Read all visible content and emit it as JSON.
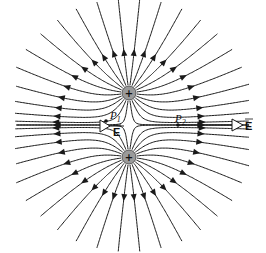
{
  "diagram": {
    "charges": [
      {
        "id": "q1",
        "sign": "+",
        "label": "+",
        "x": 129,
        "y": 93
      },
      {
        "id": "q2",
        "sign": "+",
        "label": "+",
        "x": 129,
        "y": 157
      }
    ],
    "points": [
      {
        "id": "P1",
        "label": "P",
        "subscript": "1",
        "x": 106,
        "y": 121
      },
      {
        "id": "P2",
        "label": "P",
        "subscript": "2",
        "x": 178,
        "y": 125
      }
    ],
    "field_vectors": [
      {
        "id": "E-at-P1",
        "label": "E",
        "tail_x": 124,
        "tail_y": 126,
        "dir": "left"
      },
      {
        "id": "E-at-P2",
        "label": "E",
        "tail_x": 232,
        "tail_y": 125,
        "dir": "right"
      }
    ],
    "line_color": "#1a1a1a",
    "charge_fill": "#9a9a9a"
  }
}
